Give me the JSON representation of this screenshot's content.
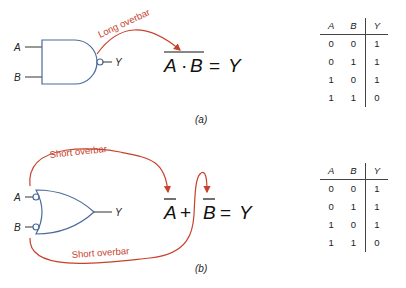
{
  "figure_a": {
    "gate": "NAND",
    "inputs": [
      "A",
      "B"
    ],
    "output": "Y",
    "annotation": "Long overbar",
    "equation": {
      "lhs": [
        "A",
        "·",
        "B"
      ],
      "eq": "=",
      "rhs": "Y",
      "overbar": "long"
    },
    "caption": "(a)",
    "truth_table": {
      "headers": [
        "A",
        "B",
        "Y"
      ],
      "rows": [
        [
          "0",
          "0",
          "1"
        ],
        [
          "0",
          "1",
          "1"
        ],
        [
          "1",
          "0",
          "1"
        ],
        [
          "1",
          "1",
          "0"
        ]
      ]
    }
  },
  "figure_b": {
    "gate": "OR with inverted inputs",
    "inputs": [
      "A",
      "B"
    ],
    "output": "Y",
    "annotation_top": "Short overbar",
    "annotation_bottom": "Short overbar",
    "equation": {
      "lhs": [
        "A",
        "+",
        "B"
      ],
      "eq": "=",
      "rhs": "Y",
      "overbar": "short"
    },
    "caption": "(b)",
    "truth_table": {
      "headers": [
        "A",
        "B",
        "Y"
      ],
      "rows": [
        [
          "0",
          "0",
          "1"
        ],
        [
          "0",
          "1",
          "1"
        ],
        [
          "1",
          "0",
          "1"
        ],
        [
          "1",
          "1",
          "0"
        ]
      ]
    }
  },
  "colors": {
    "gate_outline": "#4a6a9a",
    "annotation": "#c8412b",
    "text": "#222222"
  }
}
